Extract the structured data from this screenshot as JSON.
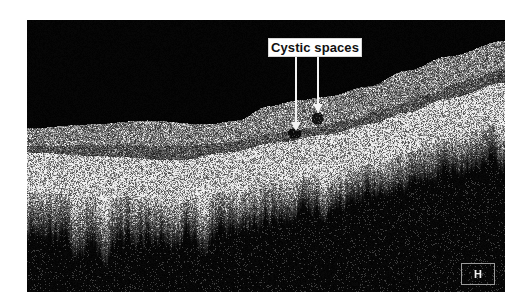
{
  "figure": {
    "annotation": {
      "label": "Cystic spaces",
      "arrow_count": 2
    },
    "panel_label": "H"
  },
  "colors": {
    "background": "#000000",
    "tissue_bright": "#e8e8e8",
    "label_bg": "#ffffff",
    "label_text": "#111111",
    "arrow": "#f4f4f4",
    "page": "#ffffff"
  }
}
